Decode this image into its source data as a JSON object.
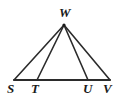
{
  "figure": {
    "type": "geometry-diagram",
    "background_color": "#ffffff",
    "stroke_color": "#2b2b2b",
    "label_color": "#1a1a1a",
    "points": {
      "W": {
        "label": "W",
        "x": 64,
        "y": 25
      },
      "S": {
        "label": "S",
        "x": 14,
        "y": 80
      },
      "T": {
        "label": "T",
        "x": 37,
        "y": 80
      },
      "U": {
        "label": "U",
        "x": 88,
        "y": 80
      },
      "V": {
        "label": "V",
        "x": 110,
        "y": 80
      }
    },
    "segments": [
      {
        "name": "base-S-V",
        "from": "S",
        "to": "V"
      },
      {
        "name": "side-W-S",
        "from": "W",
        "to": "S"
      },
      {
        "name": "cevian-W-T",
        "from": "W",
        "to": "T"
      },
      {
        "name": "cevian-W-U",
        "from": "W",
        "to": "U"
      },
      {
        "name": "side-W-V",
        "from": "W",
        "to": "V"
      }
    ]
  }
}
